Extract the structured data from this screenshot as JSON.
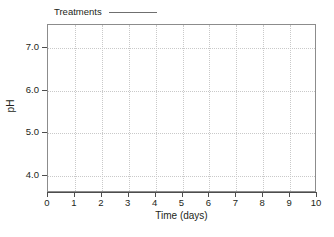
{
  "chart_data": {
    "type": "line",
    "title": "",
    "subtitle": "",
    "xlabel": "Time (days)",
    "ylabel": "pH",
    "xlim": [
      0,
      10
    ],
    "ylim": [
      3.6,
      7.55
    ],
    "x_ticks": [
      0,
      1,
      2,
      3,
      4,
      5,
      6,
      7,
      8,
      9,
      10
    ],
    "x_tick_labels": [
      "0",
      "1",
      "2",
      "3",
      "4",
      "5",
      "6",
      "7",
      "8",
      "9",
      "10"
    ],
    "y_ticks": [
      4.0,
      5.0,
      6.0,
      7.0
    ],
    "y_tick_labels": [
      "4.0",
      "5.0",
      "6.0",
      "7.0"
    ],
    "grid": true,
    "grid_style": "dotted",
    "grid_color": "#c9c9c9",
    "legend_position": "above-left",
    "series": [
      {
        "name": "Treatments",
        "style": "line",
        "color": "#6f6f6f",
        "x": [],
        "values": []
      }
    ],
    "annotations": [],
    "note": "Blank plot template: axes, gridlines and legend key are drawn but no data points are plotted."
  },
  "legend": {
    "label": "Treatments",
    "line_color": "#6f6f6f"
  },
  "axes": {
    "x_title": "Time (days)",
    "y_title": "pH",
    "x_tick_labels": [
      "0",
      "1",
      "2",
      "3",
      "4",
      "5",
      "6",
      "7",
      "8",
      "9",
      "10"
    ],
    "y_tick_labels": [
      "4.0",
      "5.0",
      "6.0",
      "7.0"
    ]
  },
  "colors": {
    "frame": "#8c8c8c",
    "axis": "#4d4d4d",
    "grid": "#c9c9c9",
    "text": "#231f20",
    "background": "#ffffff"
  }
}
